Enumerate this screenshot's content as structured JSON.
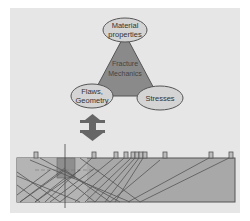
{
  "diagram": {
    "triangle": {
      "center_label_line1": "Fracture",
      "center_label_line2": "Mechanics",
      "top_node_line1": "Material",
      "top_node_line2": "properties",
      "left_node_line1": "Flaws,",
      "left_node_line2": "Geometry",
      "right_node": "Stresses"
    },
    "arrow": "double-vertical-arrow",
    "bottom": {
      "description": "cross-section of specimen with surface sensors and ray paths",
      "sensor_count": 11
    },
    "colors": {
      "background": "#e6e6e6",
      "triangle_fill": "#8a8a8a",
      "ellipse_fill": "#d4d4d4",
      "specimen_fill": "#a8a8a8",
      "line": "#555555"
    }
  }
}
